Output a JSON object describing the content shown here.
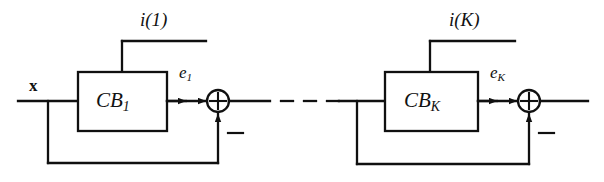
{
  "figure": {
    "type": "block-diagram",
    "stroke_color": "#101010",
    "background_color": "#ffffff"
  },
  "labels": {
    "input_signal": "x",
    "stage1": {
      "control_input": "i(1)",
      "block_name_main": "CB",
      "block_name_sub": "1",
      "error_signal_main": "e",
      "error_signal_sub": "1",
      "feedback_sign": "−"
    },
    "stageK": {
      "control_input": "i(K)",
      "block_name_main": "CB",
      "block_name_sub": "K",
      "error_signal_main": "e",
      "error_signal_sub": "K",
      "feedback_sign": "−"
    },
    "ellipsis": "dashed-continuation"
  },
  "nodes": [
    {
      "name": "codebook-block-1",
      "label": "CB₁",
      "x": 78,
      "y": 72,
      "w": 89,
      "h": 59
    },
    {
      "name": "codebook-block-k",
      "label": "CBₖ",
      "x": 385,
      "y": 72,
      "w": 93,
      "h": 59
    },
    {
      "name": "summing-junction-1",
      "label": "+",
      "cx": 218,
      "cy": 101,
      "r": 11
    },
    {
      "name": "summing-junction-k",
      "label": "+",
      "cx": 529,
      "cy": 101,
      "r": 11
    }
  ]
}
